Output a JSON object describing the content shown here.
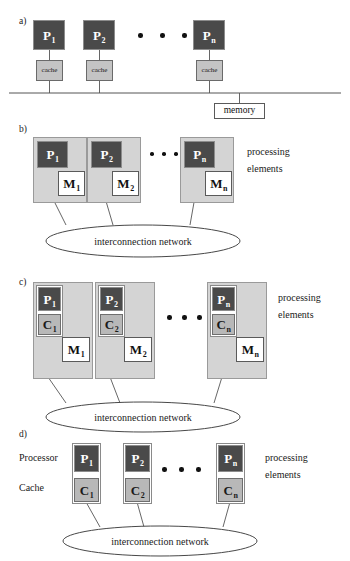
{
  "figure": {
    "panels": [
      {
        "id": "a",
        "letter": "a)",
        "processors": [
          {
            "label": "P",
            "sub": "1"
          },
          {
            "label": "P",
            "sub": "2"
          },
          {
            "label": "P",
            "sub": "n"
          }
        ],
        "cache_label": "cache",
        "memory_label": "memory",
        "ellipsis": "• • •"
      },
      {
        "id": "b",
        "letter": "b)",
        "processors": [
          {
            "label": "P",
            "sub": "1"
          },
          {
            "label": "P",
            "sub": "2"
          },
          {
            "label": "P",
            "sub": "n"
          }
        ],
        "memories": [
          {
            "label": "M",
            "sub": "1"
          },
          {
            "label": "M",
            "sub": "2"
          },
          {
            "label": "M",
            "sub": "n"
          }
        ],
        "side_label_line1": "processing",
        "side_label_line2": "elements",
        "network_label": "interconnection network"
      },
      {
        "id": "c",
        "letter": "c)",
        "processors": [
          {
            "label": "P",
            "sub": "1"
          },
          {
            "label": "P",
            "sub": "2"
          },
          {
            "label": "P",
            "sub": "n"
          }
        ],
        "caches": [
          {
            "label": "C",
            "sub": "1"
          },
          {
            "label": "C",
            "sub": "2"
          },
          {
            "label": "C",
            "sub": "n"
          }
        ],
        "memories": [
          {
            "label": "M",
            "sub": "1"
          },
          {
            "label": "M",
            "sub": "2"
          },
          {
            "label": "M",
            "sub": "n"
          }
        ],
        "side_label_line1": "processing",
        "side_label_line2": "elements",
        "network_label": "interconnection network"
      },
      {
        "id": "d",
        "letter": "d)",
        "processors": [
          {
            "label": "P",
            "sub": "1"
          },
          {
            "label": "P",
            "sub": "2"
          },
          {
            "label": "P",
            "sub": "n"
          }
        ],
        "caches": [
          {
            "label": "C",
            "sub": "1"
          },
          {
            "label": "C",
            "sub": "2"
          },
          {
            "label": "C",
            "sub": "n"
          }
        ],
        "row_label_processor": "Processor",
        "row_label_cache": "Cache",
        "side_label_line1": "processing",
        "side_label_line2": "elements",
        "network_label": "interconnection network"
      }
    ]
  },
  "colors": {
    "processor_fill": "#4a4a4a",
    "cache_fill": "#b8b8b8",
    "memory_fill": "#ffffff",
    "outer_fill": "#d4d4d4",
    "line": "#555555",
    "text": "#1a1a1a"
  }
}
